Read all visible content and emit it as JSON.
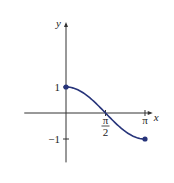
{
  "chart_data": {
    "type": "line",
    "title": "",
    "function": "y = cos(x)",
    "xlabel": "x",
    "ylabel": "y",
    "xlim": [
      -1.66,
      3.45
    ],
    "ylim": [
      -1.9,
      3.5
    ],
    "xticks": [
      {
        "value": 1.5708,
        "label_num": "π",
        "label_den": "2"
      },
      {
        "value": 3.14159,
        "label": "π"
      }
    ],
    "yticks": [
      {
        "value": 1,
        "label": "1"
      },
      {
        "value": -1,
        "label": "−1"
      }
    ],
    "series": [
      {
        "name": "cos(x)",
        "domain": [
          0,
          3.14159
        ],
        "x": [
          0,
          0.3927,
          0.7854,
          1.1781,
          1.5708,
          1.9635,
          2.3562,
          2.7489,
          3.14159
        ],
        "y": [
          1,
          0.924,
          0.707,
          0.383,
          0,
          -0.383,
          -0.707,
          -0.924,
          -1
        ],
        "endpoints": [
          [
            0,
            1
          ],
          [
            3.14159,
            -1
          ]
        ]
      }
    ],
    "grid": false,
    "legend": "none",
    "colors": {
      "curve": "#27347a",
      "axis": "#333333"
    }
  }
}
